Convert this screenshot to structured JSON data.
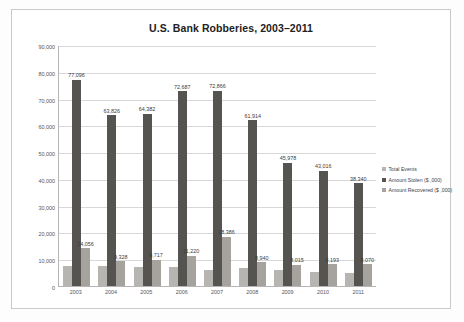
{
  "chart_data": {
    "type": "bar",
    "title": "U.S. Bank Robberies, 2003–2011",
    "xlabel": "",
    "ylabel": "",
    "ylim": [
      0,
      90000
    ],
    "ytick_labels": [
      "90,000",
      "80,000",
      "70,000",
      "60,000",
      "50,000",
      "40,000",
      "30,000",
      "20,000",
      "10,000",
      "0"
    ],
    "ytick_values": [
      90000,
      80000,
      70000,
      60000,
      50000,
      40000,
      30000,
      20000,
      10000,
      0
    ],
    "grid": true,
    "legend_position": "right",
    "categories": [
      "2003",
      "2004",
      "2005",
      "2006",
      "2007",
      "2008",
      "2009",
      "2010",
      "2011"
    ],
    "series": [
      {
        "name": "Total Events",
        "color": "#b7b5b2",
        "values": [
          7600,
          7600,
          7000,
          7100,
          6000,
          6900,
          6000,
          5400,
          5000
        ],
        "labels": [
          "",
          "",
          "",
          "",
          "",
          "",
          "",
          "",
          ""
        ]
      },
      {
        "name": "Amount Stolen ($ ,000)",
        "color": "#565450",
        "values": [
          77096,
          63826,
          64382,
          72687,
          72866,
          61914,
          45978,
          43016,
          38340
        ],
        "labels": [
          "77,096",
          "63,826",
          "64,382",
          "72,687",
          "72,866",
          "61,914",
          "45,978",
          "43,016",
          "38,340"
        ]
      },
      {
        "name": "Amount Recovered ($ ,000)",
        "color": "#a6a39f",
        "values": [
          14056,
          9328,
          9717,
          11220,
          18386,
          8940,
          8015,
          8193,
          8070
        ],
        "labels": [
          "14,056",
          "9,328",
          "9,717",
          "11,220",
          "18,386",
          "8,940",
          "8,015",
          "8,193",
          "8,070"
        ]
      }
    ]
  }
}
